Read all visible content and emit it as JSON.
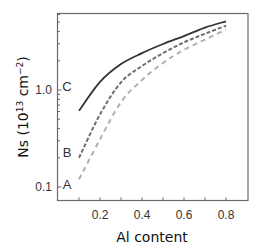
{
  "chart_data": {
    "type": "line",
    "title": "",
    "xlabel": "Al content",
    "ylabel": "Ns (10¹³ cm⁻²)",
    "ylabel_parts": {
      "main": "Ns (10",
      "sup1": "13",
      "mid": " cm",
      "sup2": "−2",
      "end": ")"
    },
    "xlim": [
      0.0,
      0.9
    ],
    "ylim": [
      0.073,
      6.2
    ],
    "yscale": "log",
    "grid": false,
    "legend": "none (inline curve labels A, B, C)",
    "x_ticks": [
      0.2,
      0.4,
      0.6,
      0.8
    ],
    "x_tick_labels": [
      "0.2",
      "0.4",
      "0.6",
      "0.8"
    ],
    "y_ticks": [
      0.1,
      1.0
    ],
    "y_tick_labels": [
      "0.1",
      "1.0"
    ],
    "x": [
      0.1,
      0.2,
      0.3,
      0.4,
      0.5,
      0.6,
      0.7,
      0.8
    ],
    "series": [
      {
        "name": "A",
        "style": "dashed",
        "color": "#b0b0b0",
        "values": [
          0.12,
          0.31,
          0.75,
          1.27,
          1.9,
          2.6,
          3.3,
          4.2
        ]
      },
      {
        "name": "B",
        "style": "dashed",
        "color": "#707070",
        "values": [
          0.2,
          0.56,
          1.2,
          1.77,
          2.4,
          3.1,
          3.8,
          4.6
        ]
      },
      {
        "name": "C",
        "style": "solid",
        "color": "#333333",
        "values": [
          0.61,
          1.21,
          1.85,
          2.4,
          2.98,
          3.6,
          4.4,
          5.1
        ]
      }
    ],
    "annotations": [
      {
        "text": "A",
        "x_px": 67,
        "y_px": 189
      },
      {
        "text": "B",
        "x_px": 67,
        "y_px": 157
      },
      {
        "text": "C",
        "x_px": 67,
        "y_px": 91
      }
    ]
  }
}
